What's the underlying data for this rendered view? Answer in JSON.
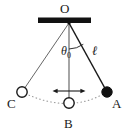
{
  "figure": {
    "background_color": "#ffffff",
    "stroke_color": "#1a1a1a",
    "bob_fill_color": "#111111",
    "open_circle_fill": "#ffffff",
    "arc_color": "#9a9a9a"
  },
  "labels": {
    "pivot": "O",
    "left_extreme": "C",
    "lowest_point": "B",
    "right_extreme": "A",
    "length": "ℓ",
    "angle": "θ",
    "angle_subscript": "0"
  },
  "geometry": {
    "support_bar": {
      "x1": 38,
      "y1": 18,
      "x2": 91,
      "y2": 23
    },
    "pivot": {
      "x": 69,
      "y": 23
    },
    "string_to_C": {
      "x": 22,
      "y": 92
    },
    "string_to_B": {
      "x": 69,
      "y": 103
    },
    "string_to_A": {
      "x": 107,
      "y": 92
    },
    "angle_arc_radius": 26,
    "swing_arrow": {
      "x1": 53,
      "y1": 91,
      "x2": 85,
      "y2": 91
    },
    "bob_radius": 5.2
  },
  "elements": {
    "support_bar_name": "ceiling-support-bar",
    "string_a_name": "string-to-position-a",
    "string_b_name": "string-to-position-b",
    "string_c_name": "string-to-position-c",
    "arc_name": "swing-path-arc",
    "bob_a_name": "pendulum-bob-at-a",
    "bob_b_name": "pendulum-bob-at-b",
    "bob_c_name": "pendulum-bob-at-c"
  }
}
